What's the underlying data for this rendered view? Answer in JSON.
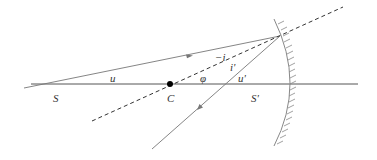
{
  "diagram": {
    "type": "spherical-mirror-ray-diagram",
    "colors": {
      "axis": "#555555",
      "ray": "#777777",
      "normal": "#333333",
      "mirror": "#888888",
      "point": "#000000",
      "label": "#333333"
    },
    "labels": {
      "source": "S",
      "center": "C",
      "image": "S'",
      "angle_u": "u",
      "angle_phi": "φ",
      "angle_u_prime": "u'",
      "angle_minus_i": "−i",
      "angle_i_prime": "i'"
    },
    "points": {
      "S": [
        55,
        84
      ],
      "C": [
        170,
        84
      ],
      "S_prime": [
        225,
        84
      ],
      "incidence": [
        280,
        36
      ],
      "mirror_vertex": [
        290,
        84
      ]
    }
  }
}
